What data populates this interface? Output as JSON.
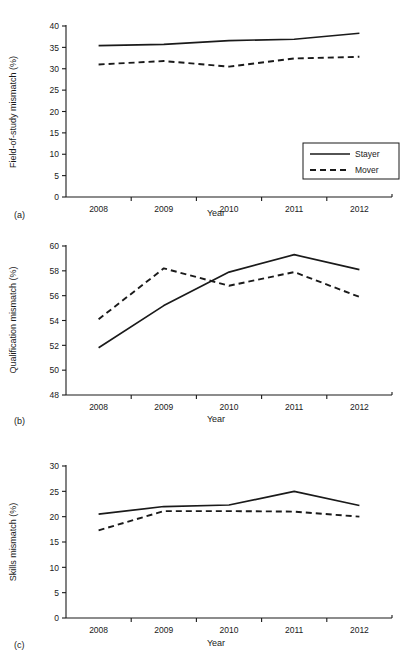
{
  "figure": {
    "panel_letters": [
      "(a)",
      "(b)",
      "(c)"
    ],
    "xlabel": "Year",
    "legend": {
      "stayer": "Stayer",
      "mover": "Mover"
    },
    "line_color": "#1a1a1a",
    "background": "#ffffff"
  },
  "chart_data": [
    {
      "type": "line",
      "panel": "(a)",
      "title": "",
      "xlabel": "Year",
      "ylabel": "Field-of-study mismatch (%)",
      "categories": [
        "2008",
        "2009",
        "2010",
        "2011",
        "2012"
      ],
      "x": [
        2008,
        2009,
        2010,
        2011,
        2012
      ],
      "ylim": [
        0,
        40
      ],
      "yticks": [
        0,
        5,
        10,
        15,
        20,
        25,
        30,
        35,
        40
      ],
      "grid": false,
      "legend_position": "lower right",
      "series": [
        {
          "name": "Stayer",
          "style": "solid",
          "values": [
            35.4,
            35.7,
            36.6,
            36.9,
            38.3
          ]
        },
        {
          "name": "Mover",
          "style": "dashed",
          "values": [
            31.0,
            31.8,
            30.5,
            32.4,
            32.8
          ]
        }
      ]
    },
    {
      "type": "line",
      "panel": "(b)",
      "title": "",
      "xlabel": "Year",
      "ylabel": "Qualification mismatch (%)",
      "categories": [
        "2008",
        "2009",
        "2010",
        "2011",
        "2012"
      ],
      "x": [
        2008,
        2009,
        2010,
        2011,
        2012
      ],
      "ylim": [
        48,
        60
      ],
      "yticks": [
        48,
        50,
        52,
        54,
        56,
        58,
        60
      ],
      "grid": false,
      "legend_position": "none",
      "series": [
        {
          "name": "Stayer",
          "style": "solid",
          "values": [
            51.8,
            55.2,
            57.9,
            59.3,
            58.1
          ]
        },
        {
          "name": "Mover",
          "style": "dashed",
          "values": [
            54.1,
            58.2,
            56.8,
            57.9,
            55.9
          ]
        }
      ]
    },
    {
      "type": "line",
      "panel": "(c)",
      "title": "",
      "xlabel": "Year",
      "ylabel": "Skills mismatch (%)",
      "categories": [
        "2008",
        "2009",
        "2010",
        "2011",
        "2012"
      ],
      "x": [
        2008,
        2009,
        2010,
        2011,
        2012
      ],
      "ylim": [
        0,
        30
      ],
      "yticks": [
        0,
        5,
        10,
        15,
        20,
        25,
        30
      ],
      "grid": false,
      "legend_position": "none",
      "series": [
        {
          "name": "Stayer",
          "style": "solid",
          "values": [
            20.5,
            22.0,
            22.3,
            25.0,
            22.2
          ]
        },
        {
          "name": "Mover",
          "style": "dashed",
          "values": [
            17.3,
            21.1,
            21.1,
            21.0,
            20.0
          ]
        }
      ]
    }
  ]
}
